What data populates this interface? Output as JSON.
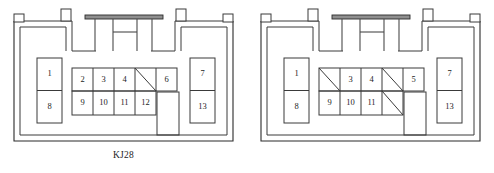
{
  "figure": {
    "type": "architectural-floor-plan-pair",
    "background_color": "#ffffff",
    "line_color": "#3a3a3a",
    "beam_color": "#8f8f8f",
    "text_color": "#1d1d1d"
  },
  "plans": [
    {
      "id": "kj28",
      "caption": "KJ28",
      "left_rooms": [
        {
          "label": "1"
        },
        {
          "label": "8"
        }
      ],
      "right_rooms": [
        {
          "label": "7"
        },
        {
          "label": "13"
        }
      ],
      "grid": {
        "columns": 5,
        "rows": 2,
        "top_row": [
          {
            "label": "2",
            "diagonal": false
          },
          {
            "label": "3",
            "diagonal": false
          },
          {
            "label": "4",
            "diagonal": false
          },
          {
            "label": "",
            "diagonal": true
          },
          {
            "label": "6",
            "diagonal": false
          }
        ],
        "bottom_row": [
          {
            "label": "9",
            "diagonal": false
          },
          {
            "label": "10",
            "diagonal": false
          },
          {
            "label": "11",
            "diagonal": false
          },
          {
            "label": "12",
            "diagonal": false
          },
          {
            "label": "",
            "diagonal": false,
            "open": true
          }
        ]
      }
    },
    {
      "id": "kj29",
      "caption": "KJ29",
      "left_rooms": [
        {
          "label": "1"
        },
        {
          "label": "8"
        }
      ],
      "right_rooms": [
        {
          "label": "7"
        },
        {
          "label": "13"
        }
      ],
      "grid": {
        "columns": 5,
        "rows": 2,
        "top_row": [
          {
            "label": "",
            "diagonal": true
          },
          {
            "label": "3",
            "diagonal": false
          },
          {
            "label": "4",
            "diagonal": false
          },
          {
            "label": "",
            "diagonal": true
          },
          {
            "label": "5",
            "diagonal": false
          }
        ],
        "bottom_row": [
          {
            "label": "9",
            "diagonal": false
          },
          {
            "label": "10",
            "diagonal": false
          },
          {
            "label": "11",
            "diagonal": false
          },
          {
            "label": "",
            "diagonal": true
          },
          {
            "label": "",
            "diagonal": false,
            "open": true
          }
        ]
      }
    }
  ]
}
